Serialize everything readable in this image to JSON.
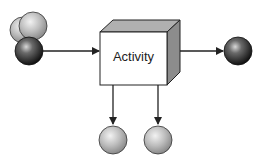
{
  "diagram": {
    "activity_label": "Activity",
    "nodes": [
      {
        "id": "input-light-1",
        "kind": "input",
        "shade": "light"
      },
      {
        "id": "input-light-2",
        "kind": "input",
        "shade": "light"
      },
      {
        "id": "input-dark",
        "kind": "input",
        "shade": "dark"
      },
      {
        "id": "activity-box",
        "kind": "process"
      },
      {
        "id": "output-dark",
        "kind": "output",
        "shade": "dark"
      },
      {
        "id": "output-light-1",
        "kind": "output",
        "shade": "light"
      },
      {
        "id": "output-light-2",
        "kind": "output",
        "shade": "light"
      }
    ],
    "edges": [
      {
        "from": "input-dark",
        "to": "activity-box"
      },
      {
        "from": "activity-box",
        "to": "output-dark"
      },
      {
        "from": "activity-box",
        "to": "output-light-1"
      },
      {
        "from": "activity-box",
        "to": "output-light-2"
      }
    ]
  }
}
